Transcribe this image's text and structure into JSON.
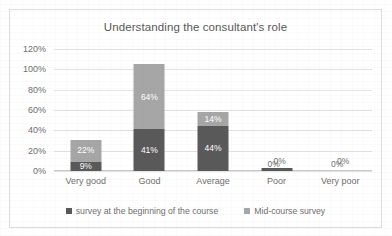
{
  "chart_data": {
    "type": "bar",
    "title": "Understanding the consultant's role",
    "xlabel": "",
    "ylabel": "",
    "categories": [
      "Very good",
      "Good",
      "Average",
      "Poor",
      "Very poor"
    ],
    "series": [
      {
        "name": "survey at the beginning of the course",
        "color": "#595959",
        "values": [
          9,
          41,
          44,
          3,
          0
        ],
        "labels": [
          "9%",
          "41%",
          "44%",
          "0%",
          "0%"
        ]
      },
      {
        "name": "Mid-course survey",
        "color": "#a6a6a6",
        "values": [
          22,
          64,
          14,
          0,
          0
        ],
        "labels": [
          "22%",
          "64%",
          "14%",
          "0%",
          "0%"
        ]
      }
    ],
    "stacked": true,
    "ylim": [
      0,
      120
    ],
    "yticks": [
      0,
      20,
      40,
      60,
      80,
      100,
      120
    ],
    "ytick_labels": [
      "0%",
      "20%",
      "40%",
      "60%",
      "80%",
      "100%",
      "120%"
    ],
    "grid": true,
    "legend_position": "bottom"
  },
  "legend": {
    "items": [
      {
        "label": "survey at the beginning of the course",
        "color": "#595959"
      },
      {
        "label": "Mid-course survey",
        "color": "#a6a6a6"
      }
    ]
  }
}
